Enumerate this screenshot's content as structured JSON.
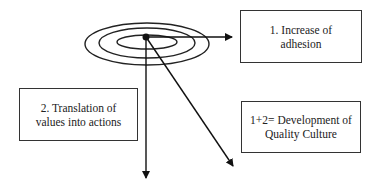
{
  "diagram": {
    "type": "concentric-target-with-arrows",
    "target": {
      "rings": 3,
      "center": "dot"
    },
    "boxes": [
      {
        "id": "box1",
        "line1": "1. Increase of",
        "line2": "adhesion"
      },
      {
        "id": "box2",
        "line1": "2. Translation of",
        "line2": "values into actions"
      },
      {
        "id": "box3",
        "line1": "1+2= Development of",
        "line2": "Quality Culture"
      }
    ],
    "arrows": [
      {
        "from": "center",
        "direction": "right",
        "to": "box1"
      },
      {
        "from": "center",
        "direction": "down"
      },
      {
        "from": "center",
        "direction": "down-right"
      }
    ],
    "colors": {
      "line": "#111111",
      "background": "#ffffff",
      "border": "#333333"
    }
  }
}
